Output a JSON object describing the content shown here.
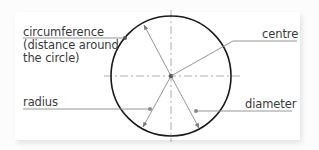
{
  "diagram": {
    "labels": {
      "circumference": "circumference",
      "circumference_note_line1": "(distance around",
      "circumference_note_line2": "the circle)",
      "centre": "centre",
      "radius": "radius",
      "diameter": "diameter"
    },
    "colors": {
      "circle_stroke": "#1a1a1a",
      "leader_line": "#8a8a8a",
      "dashed_axis": "#9a9a9a",
      "text": "#3a3a3a",
      "background": "#ffffff"
    },
    "geometry": {
      "circle_center": [
        171,
        76
      ],
      "circle_radius": 60
    }
  }
}
